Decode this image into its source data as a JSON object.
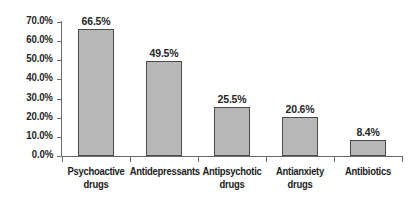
{
  "chart_data": {
    "type": "bar",
    "title": "",
    "xlabel": "",
    "ylabel": "",
    "ylim": [
      0,
      70
    ],
    "grid": false,
    "legend": "none",
    "categories": [
      "Psychoactive drugs",
      "Antidepressants",
      "Antipsychotic drugs",
      "Antianxiety drugs",
      "Antibiotics"
    ],
    "category_lines": [
      [
        "Psychoactive",
        "drugs"
      ],
      [
        "Antidepressants"
      ],
      [
        "Antipsychotic",
        "drugs"
      ],
      [
        "Antianxiety",
        "drugs"
      ],
      [
        "Antibiotics"
      ]
    ],
    "values": [
      66.5,
      49.5,
      25.5,
      20.6,
      8.4
    ],
    "value_labels": [
      "66.5%",
      "49.5%",
      "25.5%",
      "20.6%",
      "8.4%"
    ],
    "y_ticks": [
      70,
      60,
      50,
      40,
      30,
      20,
      10,
      0
    ],
    "y_tick_labels": [
      "70.0%",
      "60.0%",
      "50.0%",
      "40.0%",
      "30.0%",
      "20.0%",
      "10.0%",
      "0.0%"
    ],
    "colors": {
      "bar_fill": "#b8b8b8",
      "bar_border": "#4a4a4a",
      "axis": "#6a6a6a",
      "text": "#1d1d1d",
      "background": "#ffffff"
    }
  }
}
